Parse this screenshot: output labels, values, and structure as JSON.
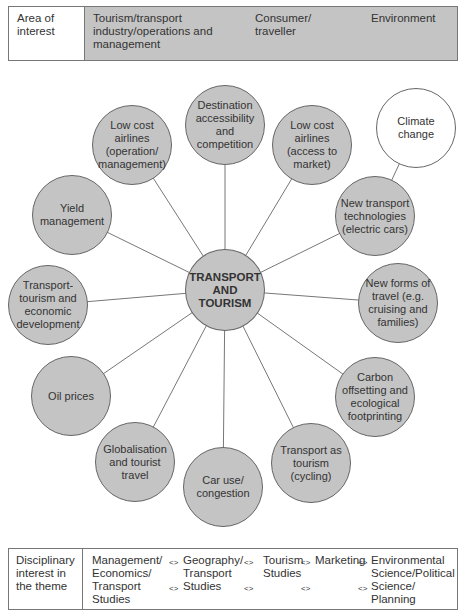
{
  "area_of_interest": {
    "label": "Area of interest",
    "columns": [
      "Tourism/transport industry/operations and management",
      "Consumer/ traveller",
      "Environment"
    ]
  },
  "diagram": {
    "center": "TRANSPORT AND TOURISM",
    "colors": {
      "node_fill": "#c4c4c4",
      "highlight_fill": "#ffffff",
      "stroke": "#666666"
    },
    "nodes": [
      {
        "id": "destination",
        "label": "Destination accessibility and competition"
      },
      {
        "id": "lowcost-op",
        "label": "Low cost airlines (operation/ management)"
      },
      {
        "id": "lowcost-access",
        "label": "Low cost airlines (access to market)"
      },
      {
        "id": "climate",
        "label": "Climate change"
      },
      {
        "id": "newtech",
        "label": "New transport technologies (electric cars)"
      },
      {
        "id": "yield",
        "label": "Yield management"
      },
      {
        "id": "econdev",
        "label": "Transport-tourism and economic development"
      },
      {
        "id": "newforms",
        "label": "New forms of travel (e.g. cruising and families)"
      },
      {
        "id": "oil",
        "label": "Oil prices"
      },
      {
        "id": "carbon",
        "label": "Carbon offsetting and ecological footprinting"
      },
      {
        "id": "globalisation",
        "label": "Globalisation and tourist travel"
      },
      {
        "id": "caruse",
        "label": "Car use/ congestion"
      },
      {
        "id": "cycling",
        "label": "Transport as tourism (cycling)"
      }
    ]
  },
  "disciplinary_interest": {
    "label": "Disciplinary interest in the theme",
    "columns": [
      "Management/ Economics/ Transport Studies",
      "Geography/ Transport Studies",
      "Tourism Studies",
      "Marketing",
      "Environmental Science/Political Science/ Planning"
    ],
    "arrow": "<>"
  }
}
